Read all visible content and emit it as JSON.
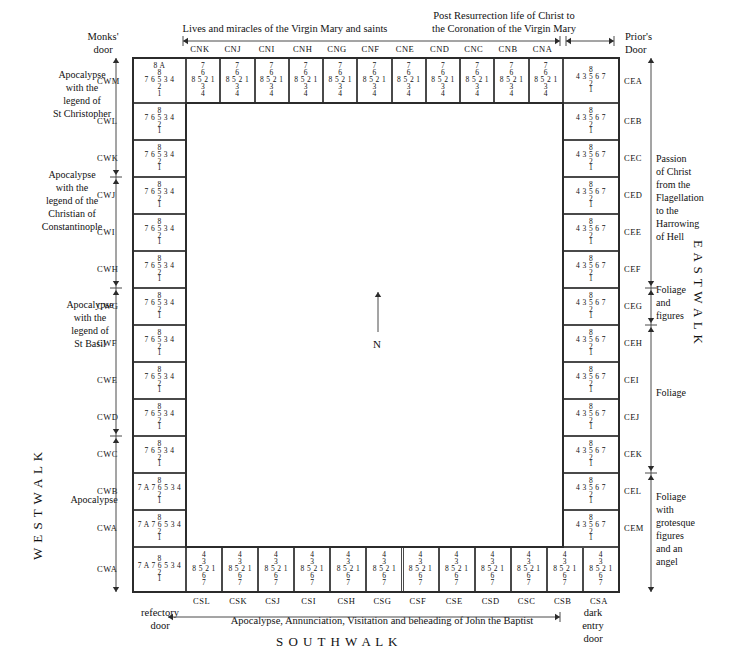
{
  "page": {
    "bottom_title": "S O U T H   W A L K",
    "west_walk": "W E S T   W A L K",
    "east_walk": "E A S T   W A L K",
    "north_compass": "N"
  },
  "doors": {
    "monks_door": "Monks'\ndoor",
    "monks_door_l1": "Monks'",
    "monks_door_l2": "door",
    "priors_door_l1": "Prior's",
    "priors_door_l2": "Door",
    "refectory_door_l1": "refectory",
    "refectory_door_l2": "door",
    "dark_entry_l1": "dark",
    "dark_entry_l2": "entry",
    "dark_entry_l3": "door"
  },
  "north_headings": [
    {
      "text": "Lives and miracles of the Virgin Mary and saints",
      "span_from": "CNK",
      "span_to": "CNF"
    },
    {
      "line1": "Post Resurrection life of Christ to",
      "line2": "the Coronation of the Virgin Mary",
      "span_from": "CNE",
      "span_to": "CNA"
    }
  ],
  "south_heading": "Apocalypse, Annunciation, Visitation and beheading of John the Baptist",
  "west_groups": [
    {
      "lines": [
        "Apocalypse",
        "with the",
        "legend of",
        "St Christopher"
      ],
      "from": "CWM",
      "to": "CWL"
    },
    {
      "lines": [
        "Apocalypse",
        "with the",
        "legend of the",
        "Christian of",
        "Constantinople"
      ],
      "from": "CWK",
      "to": "CWI"
    },
    {
      "lines": [
        "Apocalypse",
        "with the",
        "legend of",
        "St Basil"
      ],
      "from": "CWH",
      "to": "CWE"
    },
    {
      "lines": [
        "Apocalypse"
      ],
      "from": "CWD",
      "to": "CWA"
    }
  ],
  "east_groups": [
    {
      "lines": [
        "Passion",
        "of Christ",
        "from the",
        "Flagellation",
        "to the",
        "Harrowing",
        "of Hell"
      ],
      "from": "CEA",
      "to": "CEF"
    },
    {
      "lines": [
        "Foliage",
        "and",
        "figures"
      ],
      "from": "CEG",
      "to": "CEG"
    },
    {
      "lines": [
        "Foliage"
      ],
      "from": "CEH",
      "to": "CEK"
    },
    {
      "lines": [
        "Foliage",
        "with",
        "grotesque",
        "figures",
        "and an",
        "angel"
      ],
      "from": "CEL",
      "to": "CSA"
    }
  ],
  "bays": {
    "north": [
      {
        "code": "CNK",
        "rows": [
          "7",
          "6",
          "8 5 2 1",
          "3",
          "4"
        ]
      },
      {
        "code": "CNJ",
        "rows": [
          "7",
          "6",
          "8 5 2 1",
          "3",
          "4"
        ]
      },
      {
        "code": "CNI",
        "rows": [
          "7",
          "6",
          "8 5 2 1",
          "3",
          "4"
        ]
      },
      {
        "code": "CNH",
        "rows": [
          "7",
          "6",
          "8 5 2 1",
          "3",
          "4"
        ]
      },
      {
        "code": "CNG",
        "rows": [
          "7",
          "6",
          "8 5 2 1",
          "3",
          "4"
        ]
      },
      {
        "code": "CNF",
        "rows": [
          "7",
          "6",
          "8 5 2 1",
          "3",
          "4"
        ]
      },
      {
        "code": "CNE",
        "rows": [
          "7",
          "6",
          "8 5 2 1",
          "3",
          "4"
        ]
      },
      {
        "code": "CND",
        "rows": [
          "7",
          "6",
          "8 5 2 1",
          "3",
          "4"
        ]
      },
      {
        "code": "CNC",
        "rows": [
          "7",
          "6",
          "8 5 2 1",
          "3",
          "4"
        ]
      },
      {
        "code": "CNB",
        "rows": [
          "7",
          "6",
          "8 5 2 1",
          "3",
          "4"
        ]
      },
      {
        "code": "CNA",
        "rows": [
          "7",
          "6",
          "8 5 2 1",
          "3",
          "4"
        ]
      }
    ],
    "west": [
      {
        "code": "CWM",
        "rows": [
          "8 A",
          "8",
          "7 6 5 3 4",
          "2",
          "1"
        ]
      },
      {
        "code": "CWL",
        "rows": [
          "8",
          "7 6 5 3 4",
          "2",
          "1"
        ]
      },
      {
        "code": "CWK",
        "rows": [
          "8",
          "7 6 5 3 4",
          "2",
          "1"
        ]
      },
      {
        "code": "CWJ",
        "rows": [
          "8",
          "7 6 5 3 4",
          "2",
          "1"
        ]
      },
      {
        "code": "CWI",
        "rows": [
          "8",
          "7 6 5 3 4",
          "2",
          "1"
        ]
      },
      {
        "code": "CWH",
        "rows": [
          "8",
          "7 6 5 3 4",
          "2",
          "1"
        ]
      },
      {
        "code": "CWG",
        "rows": [
          "8",
          "7 6 5 3 4",
          "2",
          "1"
        ]
      },
      {
        "code": "CWF",
        "rows": [
          "8",
          "7 6 5 3 4",
          "2",
          "1"
        ]
      },
      {
        "code": "CWE",
        "rows": [
          "8",
          "7 6 5 3 4",
          "2",
          "1"
        ]
      },
      {
        "code": "CWD",
        "rows": [
          "8",
          "7 6 5 3 4",
          "2",
          "1"
        ]
      },
      {
        "code": "CWC",
        "rows": [
          "8",
          "7 6 5 3 4",
          "2",
          "1"
        ]
      },
      {
        "code": "CWB",
        "rows": [
          "8",
          "7 A 7 6 5 3 4",
          "2",
          "1"
        ]
      },
      {
        "code": "CWA",
        "rows": [
          "8",
          "7 A 7 6 5 3 4",
          "2",
          "1"
        ]
      }
    ],
    "east": [
      {
        "code": "CEA",
        "rows": [
          "8",
          "4 3 5 6 7",
          "2",
          "1"
        ]
      },
      {
        "code": "CEB",
        "rows": [
          "8",
          "4 3 5 6 7",
          "2",
          "1"
        ]
      },
      {
        "code": "CEC",
        "rows": [
          "8",
          "4 3 5 6 7",
          "2",
          "1"
        ]
      },
      {
        "code": "CED",
        "rows": [
          "8",
          "4 3 5 6 7",
          "2",
          "1"
        ]
      },
      {
        "code": "CEE",
        "rows": [
          "8",
          "4 3 5 6 7",
          "2",
          "1"
        ]
      },
      {
        "code": "CEF",
        "rows": [
          "8",
          "4 3 5 6 7",
          "2",
          "1"
        ]
      },
      {
        "code": "CEG",
        "rows": [
          "8",
          "4 3 5 6 7",
          "2",
          "1"
        ]
      },
      {
        "code": "CEH",
        "rows": [
          "8",
          "4 3 5 6 7",
          "2",
          "1"
        ]
      },
      {
        "code": "CEI",
        "rows": [
          "8",
          "4 3 5 6 7",
          "2",
          "1"
        ]
      },
      {
        "code": "CEJ",
        "rows": [
          "8",
          "4 3 5 6 7",
          "2",
          "1"
        ]
      },
      {
        "code": "CEK",
        "rows": [
          "8",
          "4 3 5 6 7",
          "2",
          "1"
        ]
      },
      {
        "code": "CEL",
        "rows": [
          "8",
          "4 3 5 6 7",
          "2",
          "1"
        ]
      },
      {
        "code": "CEM",
        "rows": [
          "8",
          "4 3 5 6 7",
          "2",
          "1"
        ]
      }
    ],
    "south": [
      {
        "code": "CSL",
        "rows": [
          "4",
          "3",
          "8 5 2 1",
          "6",
          "7"
        ]
      },
      {
        "code": "CSK",
        "rows": [
          "4",
          "3",
          "8 5 2 1",
          "6",
          "7"
        ]
      },
      {
        "code": "CSJ",
        "rows": [
          "4",
          "3",
          "8 5 2 1",
          "6",
          "7"
        ]
      },
      {
        "code": "CSI",
        "rows": [
          "4",
          "3",
          "8 5 2 1",
          "6",
          "7"
        ]
      },
      {
        "code": "CSH",
        "rows": [
          "4",
          "3",
          "8 5 2 1",
          "6",
          "7"
        ]
      },
      {
        "code": "CSG",
        "rows": [
          "4",
          "3",
          "8 5 2 1",
          "6",
          "7"
        ]
      },
      {
        "code": "CSF",
        "rows": [
          "4",
          "3",
          "8 5 2 1",
          "6",
          "7"
        ]
      },
      {
        "code": "CSE",
        "rows": [
          "4",
          "3",
          "8 5 2 1",
          "6",
          "7"
        ]
      },
      {
        "code": "CSD",
        "rows": [
          "4",
          "3",
          "8 5 2 1",
          "6",
          "7"
        ]
      },
      {
        "code": "CSC",
        "rows": [
          "4",
          "3",
          "8 5 2 1",
          "6",
          "7"
        ]
      },
      {
        "code": "CSB",
        "rows": [
          "4",
          "3",
          "8 5 2 1",
          "6",
          "7"
        ]
      },
      {
        "code": "CSA",
        "rows": [
          "4",
          "3",
          "8 5 2 1",
          "6",
          "7"
        ]
      }
    ]
  },
  "colors": {
    "ink": "#111111",
    "rule": "#4a4a4a",
    "frame": "#2b2b2b",
    "paper": "#ffffff"
  }
}
